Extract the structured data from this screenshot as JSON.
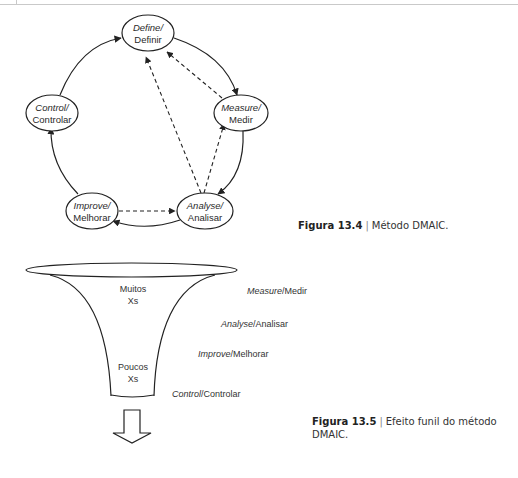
{
  "figure_13_4": {
    "nodes": {
      "define": {
        "en": "Define/",
        "pt": "Definir"
      },
      "measure": {
        "en": "Measure/",
        "pt": "Medir"
      },
      "analyse": {
        "en": "Analyse/",
        "pt": "Analisar"
      },
      "improve": {
        "en": "Improve/",
        "pt": "Melhorar"
      },
      "control": {
        "en": "Control/",
        "pt": "Controlar"
      }
    },
    "caption": {
      "label": "Figura 13.4",
      "separator": "|",
      "text": "Método DMAIC."
    }
  },
  "figure_13_5": {
    "funnel_top_text": [
      "Muitos",
      "Xs"
    ],
    "funnel_bottom_text": [
      "Poucos",
      "Xs"
    ],
    "stages": [
      {
        "en": "Measure",
        "pt": "/Medir"
      },
      {
        "en": "Analyse",
        "pt": "/Analisar"
      },
      {
        "en": "Improve",
        "pt": "/Melhorar"
      },
      {
        "en": "Control",
        "pt": "/Controlar"
      }
    ],
    "caption": {
      "label": "Figura 13.5",
      "separator": "|",
      "text_line1": "Efeito funil do método",
      "text_line2": "DMAIC."
    }
  }
}
